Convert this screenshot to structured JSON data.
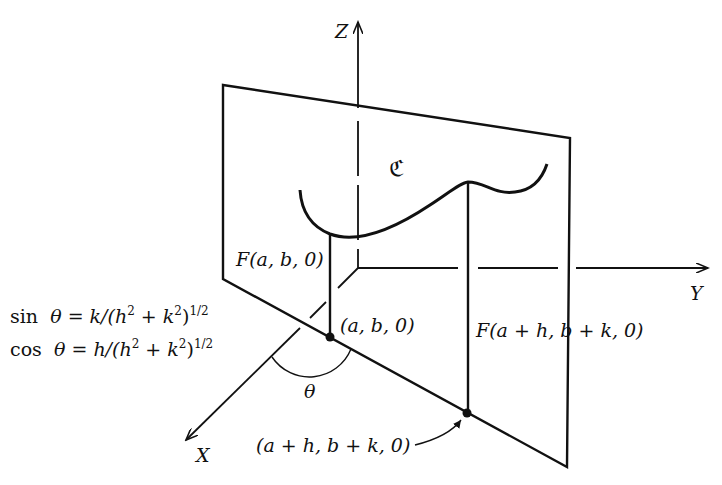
{
  "diagram": {
    "axes": {
      "x_label": "X",
      "y_label": "Y",
      "z_label": "Z"
    },
    "curve_label": "ℭ",
    "labels": {
      "f_ab0": "F(a, b, 0)",
      "point_ab0": "(a, b, 0)",
      "f_ahbk0": "F(a + h, b + k, 0)",
      "point_ahbk0": "(a + h, b + k, 0)",
      "angle": "θ"
    },
    "equations": {
      "sin_prefix": "sin",
      "sin_body": "θ = k/(h",
      "sin_mid": " + k",
      "sin_end": ")",
      "cos_prefix": "cos",
      "cos_body": "θ = h/(h",
      "cos_mid": " + k",
      "cos_end": ")",
      "exp_two": "2",
      "exp_half": "1/2"
    },
    "line_color": "#111111"
  }
}
